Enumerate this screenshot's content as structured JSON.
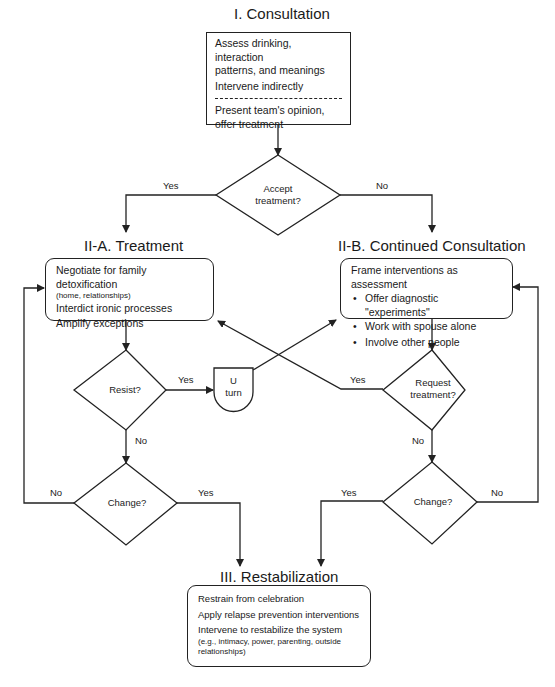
{
  "consultation": {
    "title": "I. Consultation",
    "lines": [
      "Assess drinking, interaction",
      "patterns, and meanings",
      "Intervene indirectly"
    ],
    "after_divider": [
      "Present team's opinion,",
      "offer treatment"
    ]
  },
  "accept_decision": {
    "line1": "Accept",
    "line2": "treatment?",
    "yes_label": "Yes",
    "no_label": "No"
  },
  "treatment": {
    "title": "II-A. Treatment",
    "item1": "Negotiate for family detoxification",
    "item1_note": "(home, relationships)",
    "item2": "Interdict ironic processes",
    "item3": "Amplify exceptions"
  },
  "continued_consultation": {
    "title": "II-B. Continued Consultation",
    "heading": "Frame interventions as assessment",
    "bullets": [
      "Offer diagnostic \"experiments\"",
      "Work with spouse alone",
      "Involve other people"
    ]
  },
  "resist_decision": {
    "text": "Resist?",
    "yes_label": "Yes",
    "no_label": "No"
  },
  "u_turn": {
    "line1": "U",
    "line2": "turn"
  },
  "request_decision": {
    "line1": "Request",
    "line2": "treatment?",
    "yes_label": "Yes",
    "no_label": "No"
  },
  "change_left": {
    "text": "Change?",
    "no_label": "No",
    "yes_label": "Yes"
  },
  "change_right": {
    "text": "Change?",
    "yes_label": "Yes",
    "no_label": "No"
  },
  "restabilization": {
    "title": "III. Restabilization",
    "item1": "Restrain from celebration",
    "item2": "Apply relapse prevention interventions",
    "item3": "Intervene to restabilize the system",
    "item3_note": "(e.g., intimacy, power, parenting, outside relationships)"
  },
  "colors": {
    "stroke": "#222222",
    "background": "#ffffff"
  }
}
